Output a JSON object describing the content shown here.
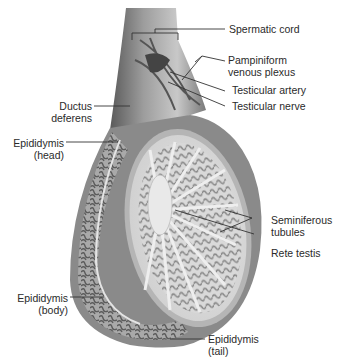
{
  "figure": {
    "labels": {
      "spermatic_cord": "Spermatic cord",
      "pampiniform_1": "Pampiniform",
      "pampiniform_2": "venous plexus",
      "testicular_artery": "Testicular artery",
      "testicular_nerve": "Testicular nerve",
      "ductus_1": "Ductus",
      "ductus_2": "deferens",
      "epi_head_1": "Epididymis",
      "epi_head_2": "(head)",
      "epi_body_1": "Epididymis",
      "epi_body_2": "(body)",
      "seminiferous_1": "Seminiferous",
      "seminiferous_2": "tubules",
      "rete_testis": "Rete testis",
      "epi_tail_1": "Epididymis",
      "epi_tail_2": "(tail)"
    },
    "colors": {
      "tissue_dark": "#6e6e6e",
      "tissue_mid": "#9a9a9a",
      "tissue_light": "#d4d4d4",
      "background": "#ffffff",
      "leader_line": "#333333"
    }
  }
}
